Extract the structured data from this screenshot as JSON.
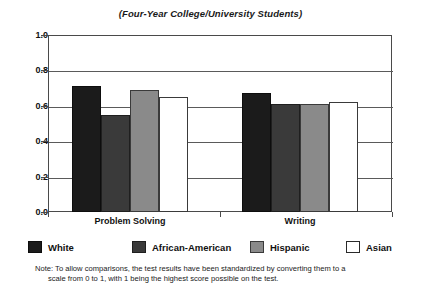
{
  "chart_data": {
    "type": "bar",
    "title": "(Four-Year College/University Students)",
    "xlabel": "",
    "ylabel": "",
    "categories": [
      "Problem Solving",
      "Writing"
    ],
    "series": [
      {
        "name": "White",
        "color": "#1b1b1b",
        "values": [
          0.71,
          0.67
        ]
      },
      {
        "name": "African-American",
        "color": "#3a3a3a",
        "values": [
          0.55,
          0.61
        ]
      },
      {
        "name": "Hispanic",
        "color": "#8a8a8a",
        "values": [
          0.69,
          0.61
        ]
      },
      {
        "name": "Asian",
        "color": "#ffffff",
        "values": [
          0.65,
          0.62
        ]
      }
    ],
    "ylim": [
      0.0,
      1.0
    ],
    "ytick_labels": [
      "0.0",
      "0.2",
      "0.4",
      "0.6",
      "0.8",
      "1.0"
    ],
    "ytick_values": [
      0.0,
      0.2,
      0.4,
      0.6,
      0.8,
      1.0
    ],
    "grid": true,
    "grid_axis": "y",
    "legend_position": "bottom",
    "annotations": [
      "Note: To allow comparisons, the test results have been standardized by converting them to a",
      "scale from 0 to 1, with 1 being the highest score possible on the test."
    ]
  },
  "footnote": {
    "line1": "Note: To allow comparisons, the test results have been standardized by converting them to a",
    "line2": "scale from 0 to 1, with 1 being the highest score possible on the test."
  }
}
